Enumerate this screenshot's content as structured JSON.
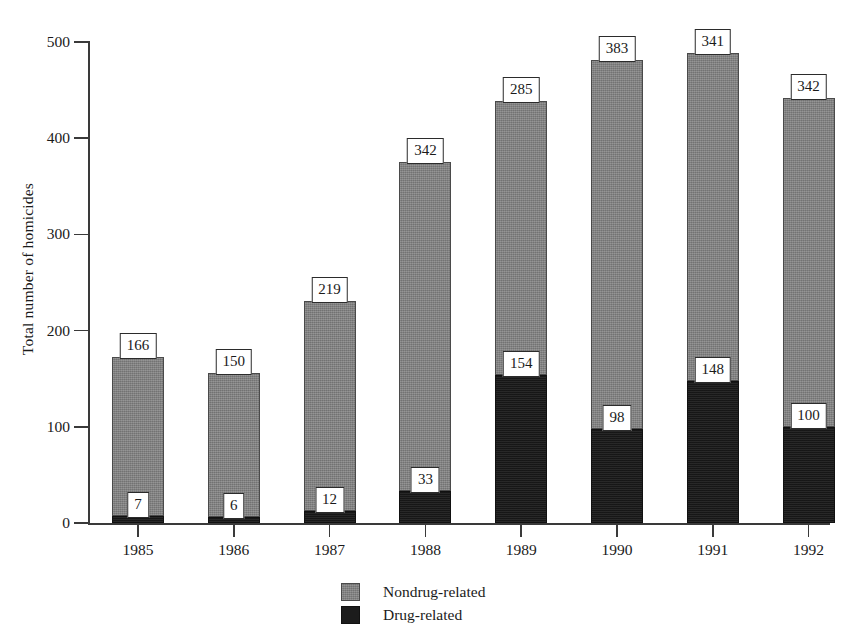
{
  "chart_data": {
    "type": "bar",
    "subtype": "stacked",
    "title": "",
    "xlabel": "",
    "ylabel": "Total number of homicides",
    "categories": [
      "1985",
      "1986",
      "1987",
      "1988",
      "1989",
      "1990",
      "1991",
      "1992"
    ],
    "series": [
      {
        "name": "Drug-related",
        "color": "#1c1c1c",
        "values": [
          7,
          6,
          12,
          33,
          154,
          98,
          148,
          100
        ]
      },
      {
        "name": "Nondrug-related",
        "color": "#808080",
        "values": [
          166,
          150,
          219,
          342,
          285,
          383,
          341,
          342
        ]
      }
    ],
    "totals": [
      173,
      156,
      231,
      375,
      439,
      481,
      489,
      442
    ],
    "ylim": [
      0,
      500
    ],
    "yticks": [
      0,
      100,
      200,
      300,
      400,
      500
    ],
    "ytick_labels": [
      "0",
      "100",
      "200",
      "300",
      "400",
      "500"
    ],
    "grid": false,
    "legend_position": "bottom-center",
    "data_labels": true,
    "stack_order": "drug-bottom"
  },
  "axis": {
    "y_label": "Total number of homicides"
  },
  "legend": {
    "entries": [
      {
        "label": "Nondrug-related",
        "swatch": "gray"
      },
      {
        "label": "Drug-related",
        "swatch": "black"
      }
    ]
  }
}
